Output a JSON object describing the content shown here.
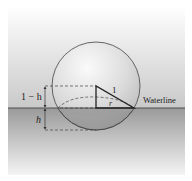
{
  "diagram": {
    "labels": {
      "upper_height": "1 − h",
      "submerged_height": "h",
      "hypotenuse": "1",
      "radius": "r",
      "waterline": "Waterline"
    },
    "colors": {
      "sky_top": "#ffffff",
      "sky_bottom": "#c9c9c9",
      "water_top": "#9a9a9a",
      "water_bottom": "#f2f2f2",
      "line": "#333333",
      "sphere_fill": "#e4e4e4",
      "submerged_cap": "#8c8c8c"
    }
  }
}
